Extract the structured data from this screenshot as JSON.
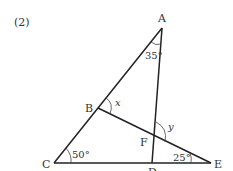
{
  "problem_number": "(2)",
  "points": {
    "A": {
      "label": "A",
      "x": 162,
      "y": 28
    },
    "B": {
      "label": "B",
      "x": 98,
      "y": 108
    },
    "C": {
      "label": "C",
      "x": 54,
      "y": 163
    },
    "D": {
      "label": "D",
      "x": 152,
      "y": 163
    },
    "E": {
      "label": "E",
      "x": 211,
      "y": 163
    },
    "F": {
      "label": "F",
      "x": 154,
      "y": 137
    }
  },
  "segments": [
    {
      "from": "A",
      "to": "C"
    },
    {
      "from": "A",
      "to": "D"
    },
    {
      "from": "B",
      "to": "E"
    },
    {
      "from": "C",
      "to": "E"
    }
  ],
  "angles": {
    "A": {
      "label": "35°"
    },
    "C": {
      "label": "50°"
    },
    "E": {
      "label": "25°"
    },
    "x": {
      "label": "x"
    },
    "y": {
      "label": "y"
    }
  },
  "colors": {
    "line": "#222222",
    "text": "#333333"
  }
}
